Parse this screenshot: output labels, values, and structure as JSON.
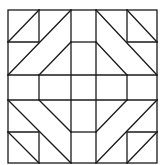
{
  "diagram": {
    "type": "quilt-block",
    "stroke_color": "#1a1a1a",
    "fill_color": "#ffffff",
    "grid_x": [
      8,
      39,
      71,
      96,
      127,
      157
    ],
    "grid_y": [
      10,
      42,
      75,
      100,
      132,
      163
    ]
  }
}
